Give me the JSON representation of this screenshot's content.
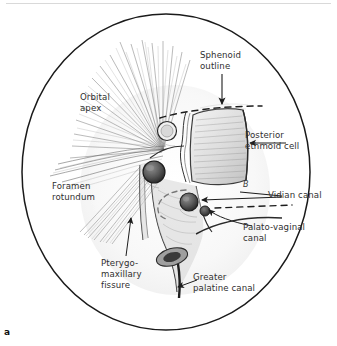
{
  "figure": {
    "letter": "a",
    "kind": "hand-drawn anatomical sketch, endoscopic view",
    "frame_shape": "ellipse"
  },
  "labels": {
    "sphenoid_outline": "Sphenoid\noutline",
    "orbital_apex": "Orbital\napex",
    "posterior_ethmoid_cell": "Posterior\nethmoid cell",
    "vidian_canal": "Vidian canal",
    "palato_vaginal_canal": "Palato-vaginal\ncanal",
    "foramen_rotundum": "Foramen\nrotundum",
    "pterygo_maxillary_fissure": "Pterygo-\nmaxillary\nfissure",
    "greater_palatine_canal": "Greater\npalatine canal",
    "small_mark": "B"
  },
  "colors": {
    "ink": "#2b2b2b",
    "label_text": "#2f2f2f",
    "frame": "#1a1a1a",
    "paper": "#ffffff",
    "shade_light": "#cfcfcf",
    "shade_mid": "#8d8d8d",
    "shade_dark": "#4a4a4a",
    "rule": "#d9d9d9"
  },
  "annotations": [
    {
      "name": "sphenoid-outline-arrow",
      "style": "straight arrow pointing down to dashed line"
    },
    {
      "name": "posterior-ethmoid-leader",
      "style": "straight leader line with arrowhead pointing left"
    },
    {
      "name": "vidian-canal-leader",
      "style": "straight leader line with arrowhead pointing left"
    },
    {
      "name": "palato-vaginal-leader",
      "style": "curved leader line with arrowhead pointing up-left"
    },
    {
      "name": "pterygo-maxillary-leader",
      "style": "straight leader with arrowhead pointing up"
    },
    {
      "name": "greater-palatine-leader",
      "style": "short leader with arrowhead pointing left"
    },
    {
      "name": "sphenoid-dashed-outline",
      "style": "horizontal dashed curve across upper drawing"
    },
    {
      "name": "dashed-recess-curve",
      "style": "dashed hooked curve in mid drawing"
    },
    {
      "name": "dashed-lower-line",
      "style": "horizontal dashed line right of vidian canal"
    }
  ]
}
